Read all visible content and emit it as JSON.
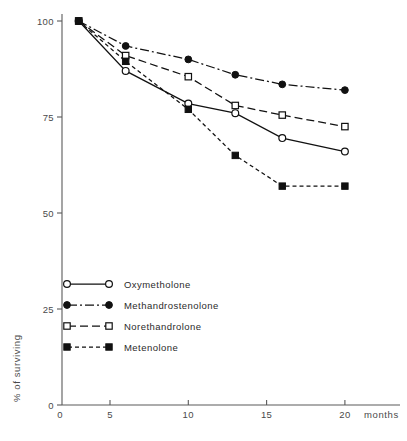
{
  "chart_data": {
    "type": "line",
    "title": "",
    "subtitle": "",
    "xlabel": "months",
    "ylabel": "% of surviving",
    "xlim": [
      0,
      22
    ],
    "ylim": [
      0,
      105
    ],
    "xticks": [
      5,
      10,
      15,
      20
    ],
    "yticks": [
      0,
      25,
      50,
      75,
      100
    ],
    "xtick_labels": [
      "5",
      "10",
      "15",
      "20"
    ],
    "ytick_labels": [
      "0",
      "25",
      "50",
      "75",
      "100"
    ],
    "grid": false,
    "legend_position": "lower left",
    "x": [
      3,
      6,
      10,
      13,
      16,
      20
    ],
    "series": [
      {
        "name": "Oxymetholone",
        "marker": "open-circle",
        "linestyle": "solid",
        "color": "#111111",
        "values": [
          100,
          87,
          78.5,
          76,
          69.5,
          66
        ]
      },
      {
        "name": "Methandrostenolone",
        "marker": "filled-circle",
        "linestyle": "dash-dot",
        "color": "#111111",
        "values": [
          100,
          93.5,
          90,
          86,
          83.5,
          82
        ]
      },
      {
        "name": "Norethandrolone",
        "marker": "open-square",
        "linestyle": "long-dash",
        "color": "#111111",
        "values": [
          100,
          91,
          85.5,
          78,
          75.5,
          72.5
        ]
      },
      {
        "name": "Metenolone",
        "marker": "filled-square",
        "linestyle": "short-dash",
        "color": "#111111",
        "values": [
          100,
          89.5,
          77,
          65,
          57,
          57
        ]
      }
    ]
  },
  "legend": {
    "entries": [
      {
        "label": "Oxymetholone"
      },
      {
        "label": "Methandrostenolone"
      },
      {
        "label": "Norethandrolone"
      },
      {
        "label": "Metenolone"
      }
    ]
  }
}
